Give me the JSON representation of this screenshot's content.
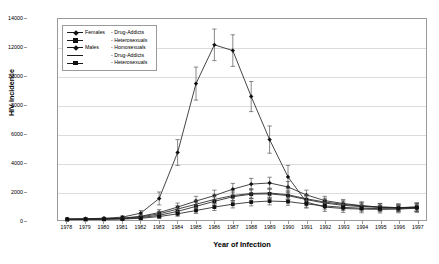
{
  "axes": {
    "y_title": "HIV Incidence",
    "x_title": "Year of Infection",
    "y_ticks": [
      "0",
      "2000",
      "4000",
      "6000",
      "8000",
      "10000",
      "12000",
      "14000"
    ],
    "x_ticks": [
      "1978",
      "1979",
      "1980",
      "1981",
      "1982",
      "1983",
      "1984",
      "1985",
      "1986",
      "1987",
      "1988",
      "1989",
      "1990",
      "1991",
      "1992",
      "1993",
      "1994",
      "1995",
      "1996",
      "1997"
    ]
  },
  "legend": {
    "rows": [
      {
        "group": "Females",
        "label": "- Drug-Addicts",
        "marker": "diamond",
        "line": "solid"
      },
      {
        "group": "",
        "label": "- Heterosexuals",
        "marker": "square",
        "line": "solid"
      },
      {
        "group": "Males",
        "label": "- Homosexuals",
        "marker": "diamond",
        "line": "solid"
      },
      {
        "group": "",
        "label": "- Drug-Addicts",
        "marker": "none",
        "line": "solid"
      },
      {
        "group": "",
        "label": "- Heterosexuals",
        "marker": "square",
        "line": "solid"
      }
    ]
  },
  "chart_data": {
    "type": "line",
    "title": "",
    "xlabel": "Year of Infection",
    "ylabel": "HIV Incidence",
    "xlim": [
      1978,
      1997
    ],
    "ylim": [
      0,
      14000
    ],
    "ytick_step": 2000,
    "grid": true,
    "legend_position": "top-left-inside",
    "error_bars": true,
    "x": [
      1978,
      1979,
      1980,
      1981,
      1982,
      1983,
      1984,
      1985,
      1986,
      1987,
      1988,
      1989,
      1990,
      1991,
      1992,
      1993,
      1994,
      1995,
      1996,
      1997
    ],
    "series": [
      {
        "name": "Females - Drug-Addicts",
        "marker": "diamond",
        "values": [
          60,
          70,
          90,
          130,
          260,
          520,
          900,
          1320,
          1700,
          2150,
          2500,
          2580,
          2300,
          1750,
          1350,
          1150,
          1000,
          900,
          860,
          900
        ],
        "err_low": [
          40,
          45,
          55,
          70,
          120,
          200,
          280,
          330,
          380,
          400,
          400,
          400,
          380,
          330,
          300,
          280,
          270,
          260,
          260,
          300
        ],
        "err_high": [
          40,
          45,
          55,
          70,
          120,
          200,
          280,
          330,
          380,
          400,
          400,
          400,
          380,
          330,
          300,
          280,
          270,
          260,
          260,
          300
        ]
      },
      {
        "name": "Females - Heterosexuals",
        "marker": "square",
        "values": [
          40,
          50,
          60,
          90,
          170,
          330,
          600,
          950,
          1300,
          1620,
          1800,
          1820,
          1700,
          1420,
          1180,
          1020,
          930,
          880,
          860,
          900
        ],
        "err_low": [
          30,
          35,
          40,
          55,
          90,
          150,
          220,
          270,
          300,
          320,
          320,
          320,
          300,
          270,
          250,
          240,
          230,
          230,
          230,
          270
        ],
        "err_high": [
          30,
          35,
          40,
          55,
          90,
          150,
          220,
          270,
          300,
          320,
          320,
          320,
          300,
          270,
          250,
          240,
          230,
          230,
          230,
          270
        ]
      },
      {
        "name": "Males - Homosexuals",
        "marker": "diamond",
        "values": [
          70,
          90,
          120,
          200,
          480,
          1500,
          4700,
          9500,
          12200,
          11800,
          8600,
          5600,
          3000,
          1250,
          900,
          800,
          760,
          740,
          760,
          820
        ],
        "err_low": [
          50,
          55,
          65,
          90,
          180,
          450,
          900,
          1150,
          1100,
          1100,
          1050,
          950,
          800,
          420,
          300,
          270,
          260,
          250,
          260,
          290
        ],
        "err_high": [
          50,
          55,
          65,
          90,
          180,
          450,
          900,
          1150,
          1100,
          1100,
          1050,
          950,
          800,
          420,
          300,
          270,
          260,
          250,
          260,
          290
        ]
      },
      {
        "name": "Males - Drug-Addicts",
        "marker": "none",
        "values": [
          50,
          60,
          80,
          110,
          220,
          430,
          760,
          1100,
          1430,
          1700,
          1850,
          1880,
          1760,
          1480,
          1250,
          1090,
          980,
          900,
          860,
          880
        ],
        "err_low": [
          35,
          40,
          50,
          65,
          105,
          175,
          240,
          290,
          320,
          340,
          340,
          340,
          320,
          290,
          265,
          250,
          245,
          240,
          240,
          280
        ],
        "err_high": [
          35,
          40,
          50,
          65,
          105,
          175,
          240,
          290,
          320,
          340,
          340,
          340,
          320,
          290,
          265,
          250,
          245,
          240,
          240,
          280
        ]
      },
      {
        "name": "Males - Heterosexuals",
        "marker": "square",
        "values": [
          30,
          35,
          45,
          65,
          120,
          240,
          430,
          660,
          900,
          1100,
          1250,
          1320,
          1280,
          1120,
          980,
          880,
          820,
          790,
          790,
          850
        ],
        "err_low": [
          25,
          28,
          33,
          45,
          75,
          120,
          170,
          210,
          240,
          260,
          265,
          265,
          255,
          235,
          220,
          210,
          205,
          205,
          210,
          250
        ],
        "err_high": [
          25,
          28,
          33,
          45,
          75,
          120,
          170,
          210,
          240,
          260,
          265,
          265,
          255,
          235,
          220,
          210,
          205,
          205,
          210,
          250
        ]
      }
    ]
  }
}
